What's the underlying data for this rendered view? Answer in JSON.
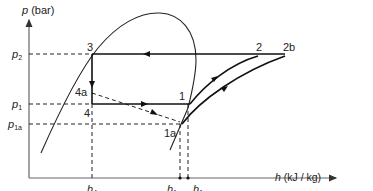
{
  "diagram": {
    "type": "p-h refrigeration cycle diagram",
    "axes": {
      "y_label_symbol": "p",
      "y_label_unit": " (bar)",
      "x_label_symbol": "h",
      "x_label_unit": " (kJ / kg)"
    },
    "pressure_levels": [
      {
        "symbol": "p",
        "subscript": "2"
      },
      {
        "symbol": "p",
        "subscript": "1"
      },
      {
        "symbol": "p",
        "subscript": "1a"
      }
    ],
    "enthalpy_marks": [
      {
        "symbol": "h",
        "subscript": "4"
      },
      {
        "symbol": "h",
        "subscript": "1a"
      },
      {
        "symbol": "h",
        "subscript": "1"
      }
    ],
    "state_points": {
      "p3": "3",
      "p4a": "4a",
      "p4": "4",
      "p1": "1",
      "p1a": "1a",
      "p2": "2",
      "p2b": "2b"
    },
    "colors": {
      "line": "#1a1a1a",
      "axis": "#555555",
      "dashed": "#222222"
    }
  }
}
